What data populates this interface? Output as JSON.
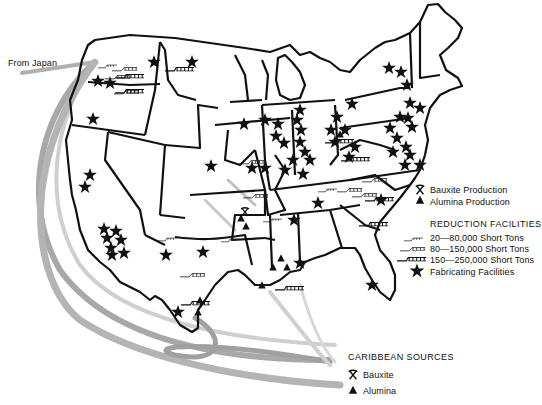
{
  "map": {
    "title": "Aluminum industry: bauxite, alumina, reduction and fabricating facilities",
    "origin_label": "From Japan",
    "legend": {
      "items": [
        {
          "symbol": "pick-hammer",
          "label": "Bauxite Production"
        },
        {
          "symbol": "triangle",
          "label": "Alumina Production"
        }
      ],
      "reduction_title": "REDUCTION FACILITIES",
      "reduction_items": [
        {
          "symbol": "small-smelter",
          "label": "20—80,000 Short Tons"
        },
        {
          "symbol": "medium-smelter",
          "label": "80—150,000 Short Tons"
        },
        {
          "symbol": "large-smelter",
          "label": "150—250,000 Short Tons"
        }
      ],
      "fabricating_label": "Fabricating Facilities"
    },
    "caribbean": {
      "title": "CARIBBEAN SOURCES",
      "items": [
        {
          "symbol": "pick-hammer",
          "label": "Bauxite"
        },
        {
          "symbol": "triangle",
          "label": "Alumina"
        }
      ]
    },
    "colors": {
      "ink": "#111111",
      "route_dark": "#9a9a9a",
      "route_light": "#cccccc",
      "background": "#ffffff"
    }
  }
}
